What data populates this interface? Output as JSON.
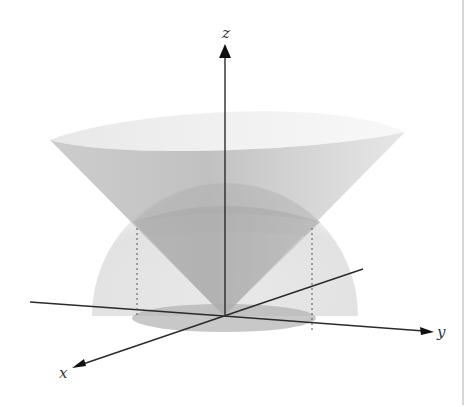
{
  "figure": {
    "axes": {
      "x": {
        "label": "x"
      },
      "y": {
        "label": "y"
      },
      "z": {
        "label": "z"
      }
    },
    "surfaces": [
      {
        "name": "cone",
        "shape": "cone opening upward from origin"
      },
      {
        "name": "hemisphere",
        "shape": "upper hemisphere centered at origin"
      },
      {
        "name": "projection-disk",
        "shape": "disk in xy-plane"
      }
    ],
    "colors": {
      "background": "#ffffff",
      "axis": "#2a2a2a",
      "cone_fill": "#bdbdbd",
      "hemisphere_fill": "#c8c8c8",
      "disk_fill": "#b0b0b0",
      "dotted_line": "#555555",
      "border": "#c8c8c8"
    }
  }
}
